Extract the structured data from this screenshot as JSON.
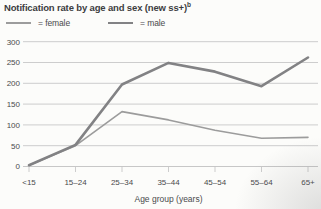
{
  "title": {
    "text": "Notification rate by age and sex (new ss+)",
    "superscript": "b"
  },
  "legend": [
    {
      "label": "= female"
    },
    {
      "label": "= male"
    }
  ],
  "chart_data": {
    "type": "line",
    "categories": [
      "<15",
      "15–24",
      "25–34",
      "35–44",
      "45–54",
      "55–64",
      "65+"
    ],
    "series": [
      {
        "name": "female",
        "values": [
          3,
          50,
          132,
          112,
          87,
          68,
          70
        ],
        "color": "#9c9c9c",
        "stroke_width": 1.6
      },
      {
        "name": "male",
        "values": [
          3,
          52,
          197,
          249,
          228,
          193,
          262
        ],
        "color": "#828284",
        "stroke_width": 2.6
      }
    ],
    "title": "Notification rate by age and sex (new ss+)",
    "xlabel": "Age group (years)",
    "ylabel": "",
    "ylim": [
      0,
      300
    ],
    "yticks": [
      0,
      50,
      100,
      150,
      200,
      250,
      300
    ],
    "grid": true,
    "legend_position": "top-left",
    "colors": {
      "gridline": "#c7c7c7",
      "axis_text": "#4a4a4c",
      "title_text": "#3d3d3f",
      "background": "#fcfcfa"
    }
  }
}
